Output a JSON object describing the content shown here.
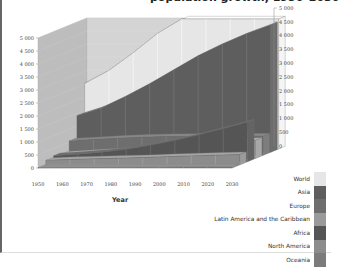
{
  "chart_data": {
    "type": "area",
    "style": "3d-layered",
    "xlabel": "Year",
    "ylabel": "",
    "units": "millions",
    "x": [
      1950,
      1960,
      1970,
      1980,
      1990,
      2000,
      2010,
      2020,
      2030
    ],
    "ylim": [
      0,
      5000
    ],
    "y_ticks": [
      "0",
      "500",
      "1 000",
      "1 500",
      "2 000",
      "2 500",
      "3 000",
      "3 500",
      "4 000",
      "4 500",
      "5 000"
    ],
    "x_ticks": [
      "1950",
      "1960",
      "1970",
      "1980",
      "1990",
      "2000",
      "2010",
      "2020",
      "2030"
    ],
    "grid": true,
    "legend_position": "bottom-right",
    "series": [
      {
        "name": "World",
        "color": "#e6e6e6",
        "values": [
          2520,
          3020,
          3700,
          4440,
          5270,
          6090,
          6900,
          7650,
          8300
        ]
      },
      {
        "name": "Asia",
        "color": "#5e5e5e",
        "values": [
          1400,
          1700,
          2140,
          2630,
          3170,
          3710,
          4160,
          4560,
          4900
        ]
      },
      {
        "name": "Europe",
        "color": "#6e6e6e",
        "values": [
          550,
          605,
          657,
          693,
          721,
          727,
          738,
          740,
          735
        ]
      },
      {
        "name": "Latin America and the Caribbean",
        "color": "#999999",
        "values": [
          167,
          220,
          285,
          362,
          443,
          521,
          590,
          650,
          700
        ]
      },
      {
        "name": "Africa",
        "color": "#555555",
        "values": [
          227,
          285,
          366,
          478,
          630,
          810,
          1030,
          1270,
          1520
        ]
      },
      {
        "name": "North America",
        "color": "#8c8c8c",
        "values": [
          172,
          204,
          231,
          254,
          280,
          313,
          344,
          370,
          395
        ]
      },
      {
        "name": "Oceania",
        "color": "#7a7a7a",
        "values": [
          13,
          16,
          20,
          23,
          27,
          31,
          37,
          41,
          45
        ]
      }
    ]
  },
  "labels": {
    "title": "population growth, 1950–2030",
    "x_axis": "Year"
  },
  "legend": [
    {
      "label": "World",
      "color": "#e6e6e6"
    },
    {
      "label": "Asia",
      "color": "#5e5e5e"
    },
    {
      "label": "Europe",
      "color": "#6e6e6e"
    },
    {
      "label": "Latin America and the Caribbean",
      "color": "#9a9a9a"
    },
    {
      "label": "Africa",
      "color": "#555555"
    },
    {
      "label": "North America",
      "color": "#8c8c8c"
    },
    {
      "label": "Oceania",
      "color": "#7b7b7b"
    }
  ]
}
